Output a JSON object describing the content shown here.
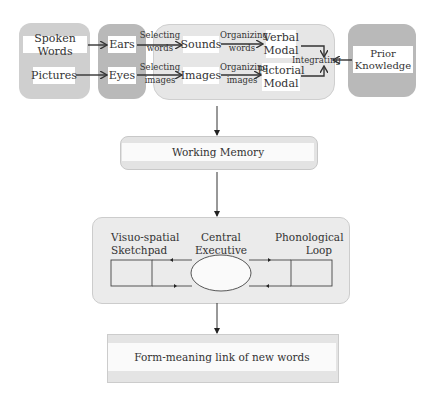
{
  "top_section": {
    "inputs": {
      "spoken_words": "Spoken Words",
      "pictures": "Pictures"
    },
    "senses": {
      "ears": "Ears",
      "eyes": "Eyes"
    },
    "selecting_words": [
      "Selecting",
      "words"
    ],
    "selecting_images": [
      "Selecting",
      "images"
    ],
    "representations": {
      "sounds": "Sounds",
      "images": "Images"
    },
    "organizing_words": [
      "Organizing",
      "words"
    ],
    "organizing_images": [
      "Organizing",
      "images"
    ],
    "modals": {
      "verbal": [
        "Verbal",
        "Modal"
      ],
      "pictorial": [
        "Pictorial",
        "Modal"
      ]
    },
    "integrating": "Integrating",
    "prior_knowledge": [
      "Prior",
      "Knowledge"
    ]
  },
  "working_memory": {
    "label": "Working Memory"
  },
  "baddeley_model": {
    "visuo_spatial": [
      "Visuo-spatial",
      "Sketchpad"
    ],
    "central_executive": [
      "Central",
      "Executive"
    ],
    "phonological_loop": [
      "Phonological",
      "Loop"
    ]
  },
  "output": {
    "label": "Form-meaning link of new words"
  },
  "colors": {
    "input_group": "#cfcfcf",
    "sense_group": "#b9b9b9",
    "processing_group": "#e6e6e6",
    "prior_knowledge_group": "#b9b9b9",
    "arrow": "#333333"
  }
}
